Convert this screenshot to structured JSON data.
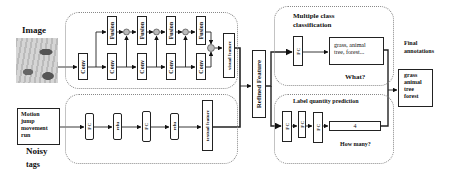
{
  "input": {
    "image_label": "Image",
    "tags_label_line1": "Noisy",
    "tags_label_line2": "tags",
    "tags": [
      "Motion",
      "jump",
      "movement",
      "run"
    ]
  },
  "visual_branch": {
    "conv_label": "Conv",
    "fusion_label": "Fusion",
    "output_label": "visual feature"
  },
  "textual_branch": {
    "blocks": [
      "FC",
      "relu",
      "FC",
      "relu"
    ],
    "output_label": "textual feature"
  },
  "refined": {
    "label": "Refined Feature"
  },
  "classification": {
    "title_line1": "Multiple class",
    "title_line2": "classification",
    "fc_label": "FC",
    "output_line1": "grass, animal",
    "output_line2": "tree, forest...",
    "question": "What?"
  },
  "quantity": {
    "title": "Label quantity prediction",
    "fc_labels": [
      "FC",
      "FC",
      "FC"
    ],
    "output_value": "4",
    "question": "How many?"
  },
  "final": {
    "title_line1": "Final",
    "title_line2": "annotations",
    "annotations": [
      "grass",
      "animal",
      "tree",
      "forest"
    ]
  }
}
